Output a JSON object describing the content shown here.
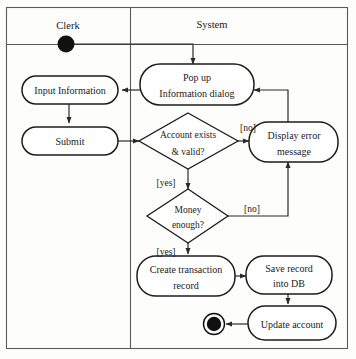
{
  "diagram": {
    "type": "uml-activity-diagram",
    "canvas": {
      "width": 356,
      "height": 359
    },
    "lanes": [
      {
        "id": "clerk",
        "title": "Clerk"
      },
      {
        "id": "system",
        "title": "System"
      }
    ],
    "nodes": {
      "start": {
        "kind": "initial-node",
        "lane": "clerk"
      },
      "input_information": {
        "kind": "action",
        "label": "Input Information",
        "lane": "clerk"
      },
      "submit": {
        "kind": "action",
        "label": "Submit",
        "lane": "clerk"
      },
      "popup_dialog": {
        "kind": "action",
        "label_line1": "Pop up",
        "label_line2": "Information dialog",
        "lane": "system"
      },
      "account_decision": {
        "kind": "decision",
        "label_line1": "Account exists",
        "label_line2": "& valid?",
        "lane": "system"
      },
      "display_error": {
        "kind": "action",
        "label_line1": "Display error",
        "label_line2": "message",
        "lane": "system"
      },
      "money_decision": {
        "kind": "decision",
        "label_line1": "Money",
        "label_line2": "enough?",
        "lane": "system"
      },
      "create_transaction": {
        "kind": "action",
        "label_line1": "Create transaction",
        "label_line2": "record",
        "lane": "system"
      },
      "save_record": {
        "kind": "action",
        "label_line1": "Save record",
        "label_line2": "into DB",
        "lane": "system"
      },
      "update_account": {
        "kind": "action",
        "label": "Update account",
        "lane": "system"
      },
      "end": {
        "kind": "final-node",
        "lane": "system"
      }
    },
    "guards": {
      "account_no": "[no]",
      "account_yes": "[yes]",
      "money_no": "[no]",
      "money_yes": "[yes]"
    },
    "colors": {
      "background": "#fdfdfc",
      "frame_stroke": "#5a5a5a",
      "node_stroke": "#1c1c1c",
      "node_fill": "#ffffff",
      "flow_stroke": "#2a2a2a",
      "node_marker": "#111111",
      "text": "#1a1a1a"
    }
  }
}
